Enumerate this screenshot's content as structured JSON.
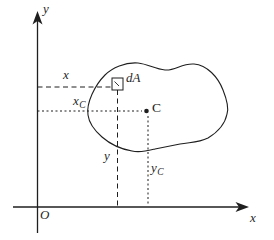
{
  "figure": {
    "background": "#ffffff",
    "ink": "#1f1f1f",
    "axes": {
      "y_axis_label": "y",
      "x_axis_label": "x",
      "origin_label": "O"
    },
    "annotations": {
      "area_element": "dA",
      "centroid": "C",
      "x_distance": "x",
      "x_c_distance": {
        "base": "x",
        "sub": "C"
      },
      "y_distance": "y",
      "y_c_distance": {
        "base": "y",
        "sub": "C"
      }
    }
  }
}
